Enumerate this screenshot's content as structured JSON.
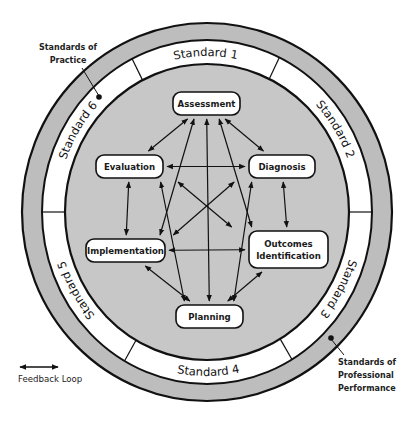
{
  "colors": {
    "outer_band": "#bdbdbd",
    "inner_disc": "#c7c7c7",
    "standards_band": "#ffffff",
    "stroke": "#111111",
    "node_fill": "#ffffff"
  },
  "rings": {
    "center": [
      207,
      212
    ],
    "outer": [
      185,
      189
    ],
    "band_inner": [
      165,
      172
    ],
    "disc": [
      142,
      148
    ]
  },
  "standards": {
    "labels": [
      {
        "id": "standard-1",
        "text": "Standard 1"
      },
      {
        "id": "standard-2",
        "text": "Standard 2"
      },
      {
        "id": "standard-3",
        "text": "Standard 3"
      },
      {
        "id": "standard-4",
        "text": "Standard 4"
      },
      {
        "id": "standard-5",
        "text": "Standard 5"
      },
      {
        "id": "standard-6",
        "text": "Standard 6"
      }
    ]
  },
  "callouts": {
    "practice": [
      "Standards of",
      "Practice"
    ],
    "professional": [
      "Standards of",
      "Professional",
      "Performance"
    ]
  },
  "nodes": [
    {
      "id": "assessment",
      "lines": [
        "Assessment"
      ],
      "x": 173,
      "y": 92,
      "w": 67,
      "h": 23
    },
    {
      "id": "evaluation",
      "lines": [
        "Evaluation"
      ],
      "x": 96,
      "y": 155,
      "w": 67,
      "h": 23
    },
    {
      "id": "diagnosis",
      "lines": [
        "Diagnosis"
      ],
      "x": 249,
      "y": 155,
      "w": 66,
      "h": 23
    },
    {
      "id": "implementation",
      "lines": [
        "Implementation"
      ],
      "x": 86,
      "y": 239,
      "w": 79,
      "h": 23
    },
    {
      "id": "outcomes-identification",
      "lines": [
        "Outcomes",
        "Identification"
      ],
      "x": 249,
      "y": 231,
      "w": 79,
      "h": 37
    },
    {
      "id": "planning",
      "lines": [
        "Planning"
      ],
      "x": 176,
      "y": 305,
      "w": 67,
      "h": 23
    }
  ],
  "edges": [
    {
      "from": "assessment",
      "to": "diagnosis",
      "type": "feedback"
    },
    {
      "from": "assessment",
      "to": "evaluation",
      "type": "feedback"
    },
    {
      "from": "diagnosis",
      "to": "outcomes-identification",
      "type": "feedback"
    },
    {
      "from": "outcomes-identification",
      "to": "planning",
      "type": "feedback"
    },
    {
      "from": "planning",
      "to": "implementation",
      "type": "feedback"
    },
    {
      "from": "implementation",
      "to": "evaluation",
      "type": "feedback"
    },
    {
      "from": "evaluation",
      "to": "diagnosis",
      "type": "feedback"
    },
    {
      "from": "implementation",
      "to": "outcomes-identification",
      "type": "feedback"
    },
    {
      "from": "evaluation",
      "to": "outcomes-identification",
      "type": "feedback"
    },
    {
      "from": "implementation",
      "to": "diagnosis",
      "type": "feedback"
    },
    {
      "from": "assessment",
      "to": "planning",
      "type": "feedback"
    },
    {
      "from": "assessment",
      "to": "implementation",
      "type": "feedback"
    },
    {
      "from": "assessment",
      "to": "outcomes-identification",
      "type": "feedback"
    },
    {
      "from": "evaluation",
      "to": "planning",
      "type": "feedback"
    },
    {
      "from": "diagnosis",
      "to": "planning",
      "type": "feedback"
    }
  ],
  "legend": {
    "label": "Feedback Loop",
    "icon": "double-headed-arrow"
  }
}
